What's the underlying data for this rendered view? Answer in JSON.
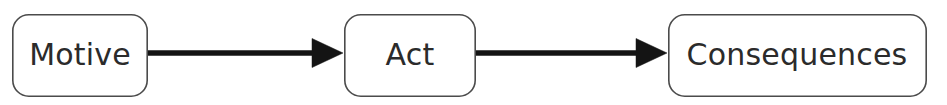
{
  "diagram": {
    "type": "linear-flow",
    "background_color": "#ffffff",
    "box_fill_color": "#ffffff",
    "box_border_color": "#4b4b4b",
    "text_color": "#2b2b2b",
    "arrow_color": "#141414",
    "nodes": [
      {
        "id": "motive",
        "label": "Motive",
        "x": 12,
        "y": 14,
        "width": 136,
        "height": 83,
        "radius": 16
      },
      {
        "id": "act",
        "label": "Act",
        "x": 344,
        "y": 14,
        "width": 132,
        "height": 83,
        "radius": 16
      },
      {
        "id": "consequences",
        "label": "Consequences",
        "x": 668,
        "y": 14,
        "width": 259,
        "height": 83,
        "radius": 16
      }
    ],
    "connectors": [
      {
        "id": "motive-to-act",
        "from": "motive",
        "to": "act",
        "x1": 148,
        "x2": 343,
        "y": 53,
        "head_width": 31,
        "head_height": 29
      },
      {
        "id": "act-to-consequences",
        "from": "act",
        "to": "consequences",
        "x1": 476,
        "x2": 667,
        "y": 53,
        "head_width": 31,
        "head_height": 29
      }
    ]
  }
}
